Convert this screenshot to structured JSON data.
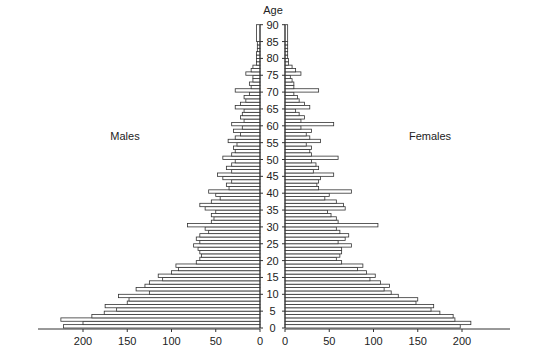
{
  "chart_data": {
    "type": "bar",
    "orientation": "horizontal",
    "subtype": "population-pyramid",
    "title": "",
    "yaxis_label": "Age",
    "yticks": [
      0,
      5,
      10,
      15,
      20,
      25,
      30,
      35,
      40,
      45,
      50,
      55,
      60,
      65,
      70,
      75,
      80,
      85,
      90
    ],
    "xticks_left": [
      200,
      150,
      100,
      50,
      0
    ],
    "xticks_right": [
      0,
      50,
      100,
      150,
      200
    ],
    "xlim": [
      0,
      250
    ],
    "ylim": [
      0,
      90
    ],
    "grid": false,
    "legend": "none",
    "annotations": [
      "Males",
      "Females"
    ],
    "ages": [
      0,
      1,
      2,
      3,
      4,
      5,
      6,
      7,
      8,
      9,
      10,
      11,
      12,
      13,
      14,
      15,
      16,
      17,
      18,
      19,
      20,
      21,
      22,
      23,
      24,
      25,
      26,
      27,
      28,
      29,
      30,
      31,
      32,
      33,
      34,
      35,
      36,
      37,
      38,
      39,
      40,
      41,
      42,
      43,
      44,
      45,
      46,
      47,
      48,
      49,
      50,
      51,
      52,
      53,
      54,
      55,
      56,
      57,
      58,
      59,
      60,
      61,
      62,
      63,
      64,
      65,
      66,
      67,
      68,
      69,
      70,
      71,
      72,
      73,
      74,
      75,
      76,
      77,
      78,
      79,
      80,
      81,
      82,
      83,
      84,
      85
    ],
    "series": [
      {
        "name": "Males",
        "values": [
          222,
          200,
          225,
          190,
          176,
          162,
          175,
          150,
          148,
          160,
          125,
          140,
          130,
          125,
          110,
          115,
          100,
          92,
          95,
          72,
          68,
          66,
          68,
          70,
          75,
          68,
          72,
          68,
          58,
          62,
          82,
          55,
          52,
          55,
          50,
          62,
          68,
          55,
          45,
          50,
          58,
          35,
          38,
          32,
          42,
          48,
          32,
          38,
          32,
          28,
          42,
          32,
          28,
          30,
          26,
          36,
          28,
          22,
          30,
          20,
          32,
          18,
          22,
          20,
          18,
          28,
          22,
          16,
          18,
          12,
          28,
          10,
          12,
          8,
          8,
          16,
          10,
          8,
          4,
          4,
          4,
          4,
          3,
          3,
          3,
          4
        ]
      },
      {
        "name": "Females",
        "values": [
          198,
          210,
          192,
          190,
          175,
          165,
          168,
          148,
          150,
          128,
          120,
          112,
          118,
          108,
          96,
          102,
          92,
          82,
          88,
          64,
          58,
          62,
          64,
          64,
          75,
          60,
          68,
          72,
          62,
          58,
          105,
          60,
          58,
          52,
          48,
          68,
          66,
          58,
          45,
          50,
          75,
          38,
          36,
          38,
          40,
          55,
          32,
          38,
          35,
          30,
          60,
          30,
          28,
          30,
          24,
          40,
          28,
          24,
          30,
          18,
          55,
          18,
          22,
          16,
          12,
          28,
          22,
          16,
          14,
          10,
          38,
          10,
          10,
          8,
          6,
          18,
          12,
          8,
          4,
          4,
          3,
          3,
          3,
          3,
          3,
          3
        ]
      }
    ],
    "top_open_bar": {
      "age_from": 85,
      "age_to": 90,
      "males": 4,
      "females": 3
    }
  },
  "labels": {
    "age": "Age",
    "males": "Males",
    "females": "Females"
  }
}
